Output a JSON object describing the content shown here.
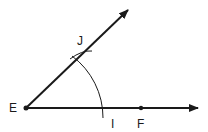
{
  "diagram": {
    "points": {
      "E": {
        "label": "E"
      },
      "J": {
        "label": "J"
      },
      "I": {
        "label": "I"
      },
      "F": {
        "label": "F"
      }
    },
    "colors": {
      "stroke": "#1a1a1a",
      "background": "#ffffff"
    }
  }
}
